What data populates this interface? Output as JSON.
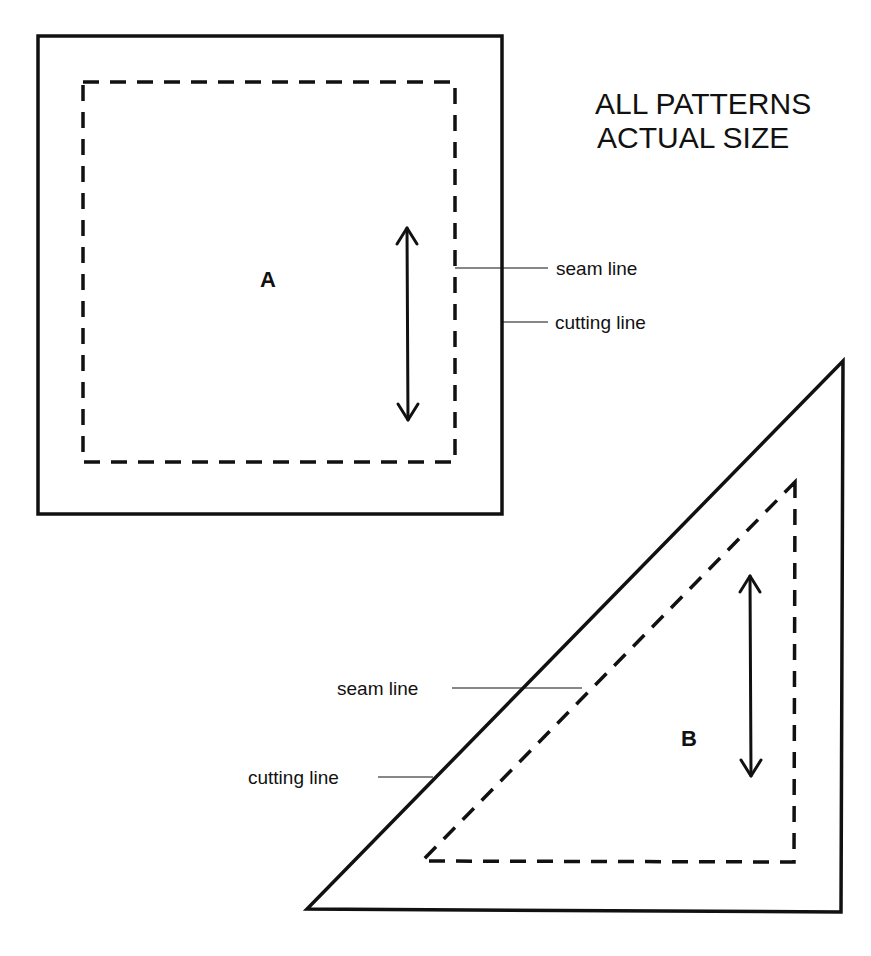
{
  "heading": {
    "line1": "ALL PATTERNS",
    "line2": "ACTUAL SIZE"
  },
  "colors": {
    "ink": "#111111",
    "paper": "#ffffff"
  },
  "pieces": [
    {
      "id": "A",
      "label": "A",
      "shape": "square",
      "cutting_line_label": "cutting line",
      "seam_line_label": "seam line",
      "grain_arrow": "vertical double-headed"
    },
    {
      "id": "B",
      "label": "B",
      "shape": "right triangle",
      "cutting_line_label": "cutting line",
      "seam_line_label": "seam line",
      "grain_arrow": "vertical double-headed"
    }
  ]
}
